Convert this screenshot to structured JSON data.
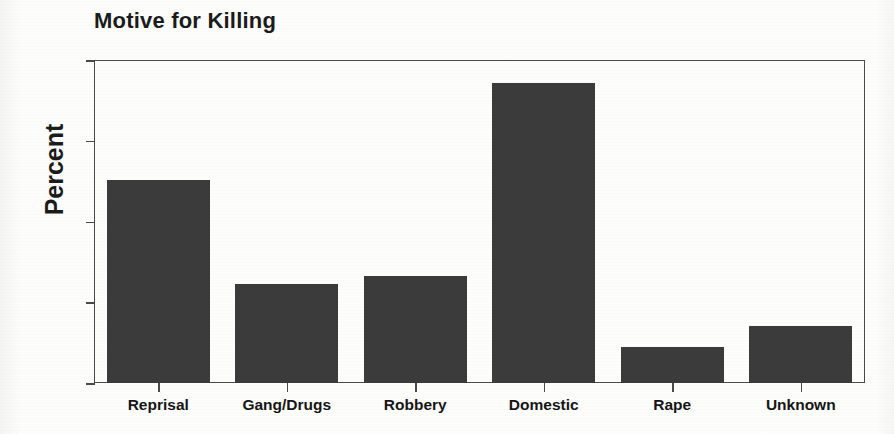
{
  "chart_data": {
    "type": "bar",
    "title": "Motive for Killing",
    "xlabel": "",
    "ylabel": "Percent",
    "categories": [
      "Reprisal",
      "Gang/Drugs",
      "Robbery",
      "Domestic",
      "Rape",
      "Unknown"
    ],
    "values": [
      25.1,
      12.2,
      13.3,
      37.2,
      4.5,
      7.1
    ],
    "ylim": [
      0,
      40
    ],
    "yticks": [
      0,
      10,
      20,
      30,
      40
    ],
    "ytick_labels": [
      "0",
      "10",
      "20",
      "30",
      "40"
    ],
    "grid": false,
    "legend": false,
    "bar_color": "#3b3b3b",
    "axis_color": "#4a4a4a",
    "background_color": "#fdfdfc"
  },
  "figure": {
    "title": "Motive for Killing",
    "y_axis_title": "Percent"
  }
}
